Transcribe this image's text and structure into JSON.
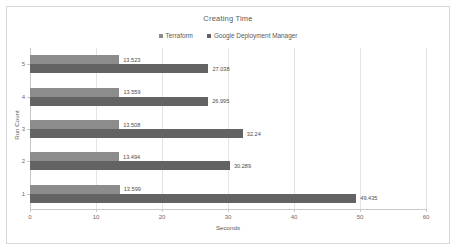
{
  "chart_data": {
    "type": "bar",
    "orientation": "horizontal",
    "title": "Creating Time",
    "xlabel": "Seconds",
    "ylabel": "Run Count",
    "categories": [
      "1",
      "2",
      "3",
      "4",
      "5"
    ],
    "xlim": [
      0,
      60
    ],
    "xticks": [
      0,
      10,
      20,
      30,
      40,
      50,
      60
    ],
    "xtick_labels": [
      "0",
      "10",
      "20",
      "30",
      "40",
      "50",
      "60"
    ],
    "grid": true,
    "legend_position": "top-center",
    "series": [
      {
        "name": "Terraform",
        "color": "#8c8c8c",
        "values": [
          13.599,
          13.494,
          13.508,
          13.559,
          13.523
        ],
        "labels": [
          "13.599",
          "13.494",
          "13.508",
          "13.559",
          "13.523"
        ]
      },
      {
        "name": "Google Deployment Manager",
        "color": "#636363",
        "values": [
          49.435,
          30.289,
          32.24,
          26.995,
          27.038
        ],
        "labels": [
          "49.435",
          "30.289",
          "32.24",
          "26.995",
          "27.038"
        ]
      }
    ]
  },
  "watermark": {
    "text": ""
  }
}
